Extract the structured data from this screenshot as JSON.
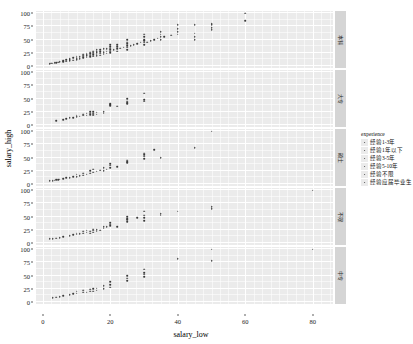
{
  "chart_data": {
    "type": "scatter",
    "title": "",
    "subtitle": "",
    "xlabel": "salary_low",
    "ylabel": "salary_high",
    "xlim": [
      -2,
      86
    ],
    "ylim": [
      -4,
      104
    ],
    "xticks": [
      0,
      20,
      40,
      60,
      80
    ],
    "yticks": [
      0,
      25,
      50,
      75,
      100
    ],
    "grid": true,
    "legend_position": "right",
    "legend": {
      "title": "experience",
      "entries": [
        {
          "label": "经验1-3年",
          "marker": "point",
          "color": "#3a3a3a"
        },
        {
          "label": "经验1年以下",
          "marker": "point",
          "color": "#3a3a3a"
        },
        {
          "label": "经验3-5年",
          "marker": "point",
          "color": "#3a3a3a"
        },
        {
          "label": "经验5-10年",
          "marker": "point",
          "color": "#3a3a3a"
        },
        {
          "label": "经验不限",
          "marker": "point",
          "color": "#3a3a3a"
        },
        {
          "label": "经验应届毕业生",
          "marker": "point",
          "color": "#3a3a3a"
        }
      ]
    },
    "facet": {
      "variable": "education",
      "direction": "rows",
      "strip_position": "right",
      "levels": [
        "本科",
        "大专",
        "硕士",
        "不限",
        "中专"
      ]
    },
    "panels": [
      {
        "strip_label": "本科",
        "x": [
          2,
          2.5,
          3,
          3.5,
          4,
          4.5,
          5,
          6,
          6,
          7,
          7,
          8,
          8,
          8,
          9,
          9,
          10,
          10,
          10,
          10,
          11,
          11,
          12,
          12,
          12,
          12,
          13,
          13,
          13,
          13,
          14,
          14,
          14,
          14,
          15,
          15,
          15,
          15,
          15,
          16,
          16,
          16,
          16,
          16,
          17,
          17,
          17,
          17,
          18,
          18,
          18,
          18,
          19,
          19,
          19,
          20,
          20,
          20,
          20,
          20,
          20,
          21,
          22,
          22,
          22,
          22,
          23,
          24,
          25,
          25,
          25,
          25,
          25,
          25,
          26,
          27,
          28,
          29,
          30,
          30,
          30,
          30,
          30,
          30,
          31,
          32,
          33,
          34,
          35,
          35,
          35,
          35,
          36,
          38,
          40,
          40,
          40,
          40,
          45,
          45,
          45,
          45,
          50,
          50,
          50,
          50,
          60,
          60
        ],
        "y": [
          4,
          5,
          5,
          6,
          6,
          7,
          8,
          8,
          10,
          9,
          12,
          10,
          12,
          14,
          11,
          15,
          12,
          14,
          16,
          18,
          14,
          17,
          15,
          18,
          20,
          22,
          16,
          19,
          21,
          24,
          17,
          20,
          23,
          26,
          18,
          21,
          24,
          26,
          28,
          19,
          22,
          25,
          27,
          30,
          20,
          24,
          27,
          30,
          22,
          25,
          28,
          32,
          24,
          28,
          32,
          25,
          28,
          30,
          33,
          36,
          40,
          30,
          28,
          32,
          36,
          40,
          33,
          35,
          30,
          35,
          38,
          42,
          45,
          50,
          38,
          40,
          42,
          45,
          40,
          45,
          48,
          50,
          55,
          60,
          45,
          48,
          50,
          52,
          50,
          55,
          60,
          65,
          55,
          58,
          60,
          65,
          70,
          78,
          50,
          55,
          62,
          78,
          68,
          72,
          78,
          80,
          85,
          100
        ]
      },
      {
        "strip_label": "大专",
        "x": [
          4,
          6,
          7,
          8,
          9,
          10,
          10,
          11,
          12,
          12,
          13,
          13,
          14,
          14,
          14,
          15,
          15,
          15,
          15,
          16,
          16,
          18,
          18,
          20,
          20,
          20,
          22,
          25,
          25,
          25,
          25,
          30,
          30,
          30
        ],
        "y": [
          8,
          10,
          12,
          13,
          14,
          15,
          18,
          16,
          18,
          20,
          18,
          22,
          19,
          22,
          25,
          18,
          20,
          22,
          25,
          20,
          24,
          22,
          25,
          36,
          38,
          40,
          35,
          40,
          42,
          45,
          50,
          45,
          48,
          60
        ]
      },
      {
        "strip_label": "硕士",
        "x": [
          2,
          3,
          3.5,
          4,
          4.5,
          5,
          6,
          7,
          8,
          9,
          10,
          10,
          11,
          12,
          12,
          13,
          14,
          14,
          15,
          15,
          16,
          17,
          18,
          18,
          19,
          20,
          20,
          20,
          22,
          25,
          25,
          25,
          30,
          30,
          30,
          30,
          33,
          35,
          45,
          50
        ],
        "y": [
          6,
          6,
          7,
          8,
          8,
          9,
          10,
          12,
          12,
          14,
          14,
          18,
          15,
          16,
          20,
          18,
          20,
          25,
          22,
          28,
          24,
          26,
          25,
          30,
          28,
          30,
          35,
          38,
          32,
          40,
          42,
          45,
          48,
          52,
          55,
          58,
          65,
          50,
          68,
          100
        ]
      },
      {
        "strip_label": "不限",
        "x": [
          2,
          3,
          4,
          5,
          6,
          8,
          9,
          10,
          10,
          11,
          12,
          12,
          13,
          13,
          14,
          14,
          15,
          15,
          15,
          16,
          16,
          17,
          18,
          18,
          19,
          20,
          20,
          20,
          22,
          25,
          25,
          25,
          25,
          28,
          30,
          30,
          30,
          30,
          35,
          35,
          40,
          50,
          50,
          80
        ],
        "y": [
          8,
          8,
          9,
          10,
          12,
          14,
          15,
          16,
          18,
          17,
          18,
          22,
          20,
          24,
          18,
          22,
          20,
          24,
          26,
          22,
          25,
          24,
          28,
          30,
          30,
          32,
          35,
          38,
          30,
          40,
          44,
          46,
          50,
          48,
          42,
          48,
          52,
          60,
          52,
          55,
          60,
          65,
          68,
          100
        ]
      },
      {
        "strip_label": "中专",
        "x": [
          3,
          4,
          5,
          6,
          8,
          9,
          10,
          10,
          12,
          12,
          13,
          14,
          14,
          15,
          15,
          16,
          16,
          18,
          18,
          20,
          20,
          20,
          25,
          25,
          25,
          30,
          30,
          30,
          30,
          40,
          50,
          50,
          80
        ],
        "y": [
          8,
          9,
          10,
          12,
          14,
          15,
          16,
          20,
          18,
          22,
          18,
          20,
          24,
          20,
          25,
          22,
          26,
          25,
          30,
          28,
          32,
          38,
          40,
          45,
          50,
          48,
          52,
          55,
          62,
          82,
          78,
          100,
          100
        ]
      }
    ]
  }
}
